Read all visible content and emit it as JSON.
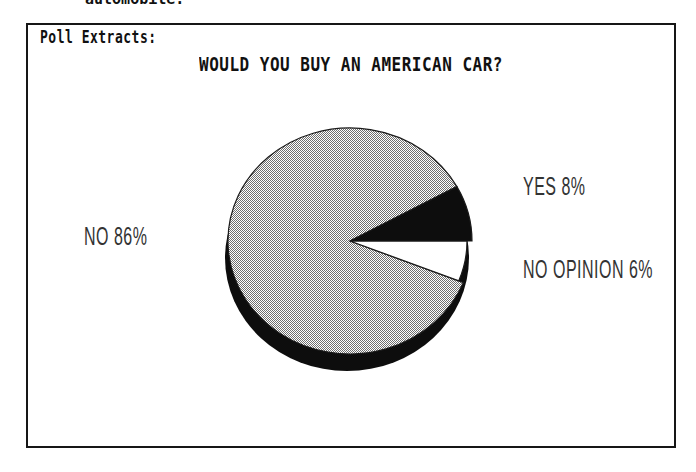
{
  "context": {
    "clipped_text_above": "automobile."
  },
  "panel": {
    "heading": "Poll Extracts:"
  },
  "chart_data": {
    "type": "pie",
    "title": "WOULD YOU BUY AN AMERICAN CAR?",
    "units": "percent",
    "total_percent": 100,
    "slices": [
      {
        "name": "NO",
        "value": 86,
        "label": "NO 86%",
        "fill": "hatch",
        "inset": 0,
        "label_pos": {
          "x": 84,
          "y": 224
        }
      },
      {
        "name": "NO OPINION",
        "value": 6,
        "label": "NO OPINION 6%",
        "fill": "#ffffff",
        "inset": 5,
        "label_pos": {
          "x": 523,
          "y": 257
        }
      },
      {
        "name": "YES",
        "value": 8,
        "label": "YES 8%",
        "fill": "#0d0d0d",
        "inset": 0,
        "label_pos": {
          "x": 523,
          "y": 174
        }
      }
    ],
    "geometry": {
      "cx": 350,
      "cy": 241,
      "rx": 122,
      "ry": 113,
      "rim_dx": -3,
      "rim_dy": 17,
      "start_angle_deg": 28.8,
      "direction": "ccw"
    },
    "style": {
      "effect": "3d-extruded-rim",
      "rim_color": "#0d0d0d",
      "outline_color": "#1a1a1a",
      "hatch_dot_color": "#6f6f6f",
      "hatch_bg_color": "#ffffff",
      "legend": "none",
      "labels": "beside-slices"
    }
  },
  "colors": {
    "page_bg": "#ffffff",
    "panel_border": "#161616",
    "heading_text": "#111111",
    "plotter_text": "#333333"
  }
}
